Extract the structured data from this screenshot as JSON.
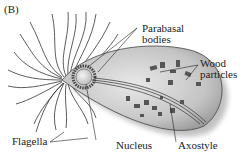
{
  "figure": {
    "panel_label": "(B)",
    "labels": {
      "parabasal_bodies_line1": "Parabasal",
      "parabasal_bodies_line2": "bodies",
      "wood_particles_line1": "Wood",
      "wood_particles_line2": "particles",
      "flagella": "Flagella",
      "nucleus": "Nucleus",
      "axostyle": "Axostyle"
    },
    "colors": {
      "ink": "#222222",
      "cell_fill": "#cfcfcf",
      "cell_shade": "#a9a9a9",
      "nucleus_fill": "#e6e6e6",
      "particles": "#555555"
    }
  }
}
